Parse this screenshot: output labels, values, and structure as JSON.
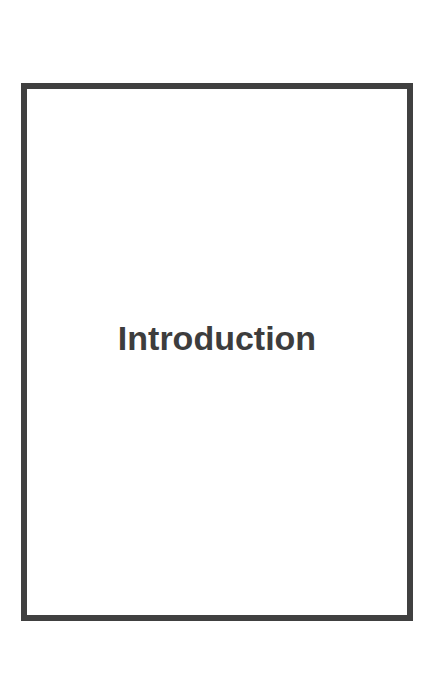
{
  "page": {
    "title": "Introduction",
    "border_color": "#404040",
    "text_color": "#3d3d3d"
  }
}
